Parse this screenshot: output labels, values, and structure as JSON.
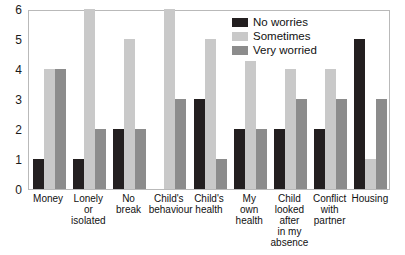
{
  "chart_data": {
    "type": "bar",
    "title": "",
    "subtitle": "",
    "xlabel": "",
    "ylabel": "",
    "ylim": [
      0,
      6
    ],
    "yticks": [
      "0",
      "1",
      "2",
      "3",
      "4",
      "5",
      "6"
    ],
    "grid": false,
    "legend_position": "top-right",
    "orientation": "vertical grouped",
    "categories": [
      "Money",
      "Lonely or isolated",
      "No break",
      "Child's behaviour",
      "Child's health",
      "My own health",
      "Child looked after in my absence",
      "Conflict with partner",
      "Housing"
    ],
    "category_label_lines": [
      [
        "Money"
      ],
      [
        "Lonely",
        "or",
        "isolated"
      ],
      [
        "No",
        "break"
      ],
      [
        "Child's",
        "behaviour"
      ],
      [
        "Child's",
        "health"
      ],
      [
        "My",
        "own",
        "health"
      ],
      [
        "Child",
        "looked",
        "after",
        "in my",
        "absence"
      ],
      [
        "Conflict",
        "with",
        "partner"
      ],
      [
        "Housing"
      ]
    ],
    "series": [
      {
        "name": "No worries",
        "color": "#231f20",
        "values": [
          1,
          1,
          2,
          0,
          3,
          2,
          2,
          2,
          5
        ]
      },
      {
        "name": "Sometimes",
        "color": "#c9c9c9",
        "values": [
          4,
          6,
          5,
          6,
          5,
          5,
          4,
          4,
          1
        ]
      },
      {
        "name": "Very worried",
        "color": "#8c8c8c",
        "values": [
          4,
          2,
          2,
          3,
          1,
          2,
          3,
          3,
          3
        ]
      }
    ]
  }
}
